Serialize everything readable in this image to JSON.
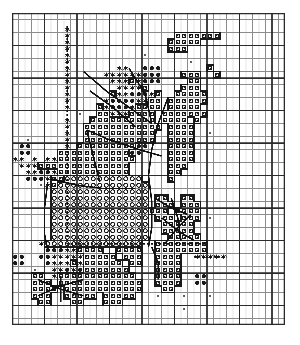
{
  "document": {
    "kind": "cross-stitch-pattern-chart",
    "title": "Cross Stitch Pattern Chart",
    "background_color": "#ffffff",
    "ink_color": "#1a1a1a"
  },
  "grid": {
    "origin_x": 12,
    "origin_y": 13,
    "cell_size": 6.5,
    "columns": 42,
    "rows": 48,
    "minor_line_color": "#8c8c8c",
    "minor_line_width": 1,
    "major_line_color": "#2b2b2b",
    "major_line_width": 2,
    "major_every": 5,
    "border_color": "#2b2b2b",
    "border_width": 2
  },
  "legend": {
    "symbols": [
      {
        "key": "star",
        "name": "star-symbol",
        "glyph": "★",
        "description": "filled six point star stitch"
      },
      {
        "key": "dot",
        "name": "filled-circle-symbol",
        "glyph": "●",
        "description": "solid filled circle stitch"
      },
      {
        "key": "open",
        "name": "open-circle-symbol",
        "glyph": "○",
        "description": "open ring circle stitch"
      },
      {
        "key": "sq",
        "name": "square-dot-symbol",
        "glyph": "▣",
        "description": "small square with centre dot"
      },
      {
        "key": "tiny",
        "name": "tiny-speck-symbol",
        "glyph": "·",
        "description": "isolated faint speck stitch"
      }
    ],
    "backstitch": {
      "name": "backstitch-line",
      "solid_color": "#111111",
      "solid_width": 2,
      "dashed_color": "#111111",
      "dashed_width": 2,
      "dash_pattern": [
        2,
        2
      ]
    }
  },
  "chart_data": {
    "type": "heatmap",
    "xlabel": "",
    "ylabel": "",
    "columns": 42,
    "rows": 48,
    "legend_position": "none",
    "grid": true,
    "symbol_key": ".=empty, *=star, o=filled-dot, O=open-circle, s=square-dot, ,=tiny-speck",
    "cells": [
      "..........................................",
      "..........................................",
      "........*.................................",
      "........*................sssssss..........",
      "........*...............sssss.............",
      "........*...............sss...............",
      "........*...........,.....................",
      "........*..................,..............",
      "........*.......**..ooo.......s...........",
      "........*.....******ooo...sss..s..........",
      "........*......***s*ooo....ss.............",
      "........*.......****s.....sss.............",
      "........*......s**ooo*s..sssss............",
      "........*.....*oooo**ss.ssssss............",
      "........*....s*ooo*ssss.sssss.............",
      "..........,..ss***ssss.sssssss............",
      "........*...ssssssssss.ssss.s.............",
      "........*..ssssssssssss.ssss..............",
      "........*..sssssssssss..ssss..,...........",
      "..,.....*..sssssssssss..ssss..............",
      ".oo.....*.sssssssssoo...ssss..............",
      ".oo....sssssssssssoo....ssss..............",
      "**.*.**ssssssssssss.....ssss..............",
      ".***ssssssssssssss......sss...............",
      "..**oo*sssssssssss......ss................",
      "..ooo*ssOOOOOOOOOOOO....s.................",
      "....,*sOOOOOOOOOOOOOO.....................",
      "......OOOOOOOOOOOOOOO.....................",
      "......OOOOOOOOOOOOOOO.ss..ss..............",
      "......OOOOOOOOOOOOOOO.sss.sss.............",
      "......OOOOOOOOOOOOOOOsss.ssss.............",
      "......OOOOOOOOOOOOOOO.sss.sss.,...........",
      "......OOOOOOOOOOOOOOO..sssss..............",
      "......OOOOOOOOOOOOOOO..sssss..............",
      "......OOOOOOOOOOOOOOO...sssss.............",
      "....*OOOOOOOOOOOOOOO..ssssssss............",
      ".....ooo**ssss..ssss..ssssssss............",
      "oo..oo*****sssss.sss..ssss..*****.........",
      "oo...o***s*ssssss.ss..ssss................",
      "...,..**o*osssssss....ssss................",
      "...ss.*ssssssssssss...ssss..oo............",
      "...sss.sssssssssssss..ssss..oo............",
      "...ssss.ssssssssssss...ss.................",
      "...sss..sssss.sssss...,...,...,...........",
      "....ss...ss...sss.........................",
      "..........................,...............",
      "..........................................",
      ".........................................."
    ],
    "backstitch_paths": [
      {
        "style": "dashed",
        "points": [
          [
            8.5,
            2.0
          ],
          [
            8.5,
            20.0
          ]
        ]
      },
      {
        "style": "dashed",
        "points": [
          [
            8.5,
            20.0
          ],
          [
            8.5,
            35.5
          ]
        ]
      },
      {
        "style": "dashed",
        "points": [
          [
            8.5,
            35.5
          ],
          [
            30.0,
            35.5
          ]
        ]
      },
      {
        "style": "solid",
        "points": [
          [
            11.0,
            9.0
          ],
          [
            14.5,
            12.0
          ],
          [
            18.0,
            14.5
          ],
          [
            21.5,
            17.0
          ]
        ]
      },
      {
        "style": "solid",
        "points": [
          [
            18.0,
            8.5
          ],
          [
            20.5,
            12.5
          ],
          [
            21.5,
            17.0
          ]
        ]
      },
      {
        "style": "solid",
        "points": [
          [
            12.0,
            12.0
          ],
          [
            15.5,
            14.5
          ],
          [
            19.0,
            17.5
          ]
        ]
      },
      {
        "style": "solid",
        "points": [
          [
            11.5,
            18.0
          ],
          [
            15.0,
            19.5
          ],
          [
            19.5,
            21.0
          ],
          [
            23.0,
            22.0
          ]
        ]
      },
      {
        "style": "solid",
        "points": [
          [
            11.5,
            18.0
          ],
          [
            12.5,
            22.0
          ],
          [
            13.5,
            26.0
          ]
        ]
      },
      {
        "style": "solid",
        "points": [
          [
            24.0,
            13.0
          ],
          [
            22.5,
            17.0
          ],
          [
            21.5,
            21.0
          ],
          [
            21.0,
            25.0
          ]
        ]
      },
      {
        "style": "solid",
        "points": [
          [
            6.0,
            25.5
          ],
          [
            10.0,
            26.5
          ],
          [
            14.0,
            27.0
          ],
          [
            19.0,
            27.0
          ]
        ]
      },
      {
        "style": "solid",
        "points": [
          [
            5.5,
            26.0
          ],
          [
            5.0,
            30.0
          ],
          [
            5.0,
            34.0
          ],
          [
            5.5,
            36.5
          ]
        ]
      },
      {
        "style": "solid",
        "points": [
          [
            21.0,
            25.0
          ],
          [
            21.5,
            29.0
          ],
          [
            21.5,
            33.0
          ],
          [
            21.0,
            36.0
          ]
        ]
      },
      {
        "style": "solid",
        "points": [
          [
            22.0,
            28.5
          ],
          [
            24.5,
            30.0
          ],
          [
            27.0,
            31.0
          ]
        ]
      },
      {
        "style": "solid",
        "points": [
          [
            24.5,
            28.5
          ],
          [
            25.5,
            31.5
          ],
          [
            26.0,
            35.0
          ]
        ]
      },
      {
        "style": "solid",
        "points": [
          [
            23.0,
            31.5
          ],
          [
            25.5,
            33.5
          ],
          [
            28.0,
            35.0
          ]
        ]
      },
      {
        "style": "solid",
        "points": [
          [
            27.5,
            31.0
          ],
          [
            25.5,
            33.0
          ],
          [
            23.5,
            35.5
          ]
        ]
      },
      {
        "style": "solid",
        "points": [
          [
            21.5,
            36.0
          ],
          [
            22.5,
            38.5
          ],
          [
            22.5,
            41.0
          ]
        ]
      },
      {
        "style": "solid",
        "points": [
          [
            4.0,
            41.0
          ],
          [
            7.5,
            42.5
          ],
          [
            11.0,
            43.5
          ]
        ]
      },
      {
        "style": "solid",
        "points": [
          [
            4.0,
            43.5
          ],
          [
            7.5,
            42.0
          ],
          [
            11.0,
            41.0
          ]
        ]
      },
      {
        "style": "solid",
        "points": [
          [
            7.5,
            40.5
          ],
          [
            7.5,
            44.5
          ]
        ]
      },
      {
        "style": "dashed",
        "points": [
          [
            28.0,
            37.5
          ],
          [
            33.0,
            37.5
          ]
        ]
      }
    ]
  }
}
